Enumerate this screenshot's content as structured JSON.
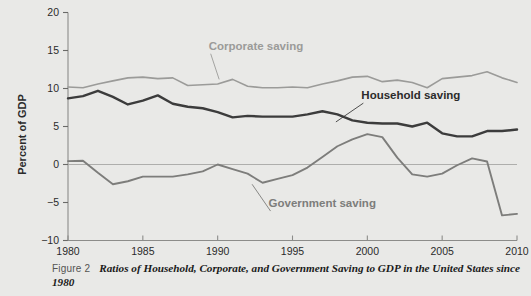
{
  "figure": {
    "caption_label": "Figure 2",
    "caption_title": "Ratios of Household, Corporate, and Government Saving to GDP in the United States since 1980",
    "background_color": "#e9e9e7"
  },
  "chart_data": {
    "type": "line",
    "title": "",
    "subtitle": "",
    "xlabel": "",
    "ylabel": "Percent of GDP",
    "xlim": [
      1980,
      2010
    ],
    "ylim": [
      -10,
      20
    ],
    "grid": false,
    "zero_line": true,
    "legend_position": "inline-annotations",
    "x_ticks": [
      1980,
      1985,
      1990,
      1995,
      2000,
      2005,
      2010
    ],
    "x_tick_labels": [
      "1980",
      "1985",
      "1990",
      "1995",
      "2000",
      "2005",
      "2010"
    ],
    "y_ticks": [
      -10,
      -5,
      0,
      5,
      10,
      15,
      20
    ],
    "y_tick_labels": [
      "−10",
      "−5",
      "0",
      "5",
      "10",
      "15",
      "20"
    ],
    "x": [
      1980,
      1981,
      1982,
      1983,
      1984,
      1985,
      1986,
      1987,
      1988,
      1989,
      1990,
      1991,
      1992,
      1993,
      1994,
      1995,
      1996,
      1997,
      1998,
      1999,
      2000,
      2001,
      2002,
      2003,
      2004,
      2005,
      2006,
      2007,
      2008,
      2009,
      2010
    ],
    "series": [
      {
        "name": "Corporate saving",
        "color": "#9b9b99",
        "width": 1.6,
        "values": [
          10.2,
          10.1,
          10.6,
          11.0,
          11.4,
          11.5,
          11.3,
          11.4,
          10.4,
          10.5,
          10.6,
          11.2,
          10.3,
          10.1,
          10.1,
          10.2,
          10.1,
          10.6,
          11.0,
          11.5,
          11.6,
          10.9,
          11.1,
          10.8,
          10.1,
          11.3,
          11.5,
          11.7,
          12.2,
          11.4,
          10.8
        ],
        "label_position": {
          "x": 1989.4,
          "y": 15.1
        },
        "leader_to": {
          "x": 1990.1,
          "y": 11.2
        }
      },
      {
        "name": "Household saving",
        "color": "#3c3c3c",
        "width": 2.4,
        "values": [
          8.7,
          9.0,
          9.7,
          8.9,
          7.9,
          8.4,
          9.1,
          8.0,
          7.6,
          7.4,
          6.9,
          6.2,
          6.4,
          6.3,
          6.3,
          6.3,
          6.6,
          7.0,
          6.6,
          5.8,
          5.5,
          5.4,
          5.4,
          5.0,
          5.5,
          4.1,
          3.7,
          3.7,
          4.4,
          4.4,
          4.6
        ],
        "label_position": {
          "x": 1999.6,
          "y": 8.6
        },
        "leader_to": {
          "x": 1997.9,
          "y": 5.6
        }
      },
      {
        "name": "Government saving",
        "color": "#7d7d7b",
        "width": 1.9,
        "values": [
          0.45,
          0.5,
          -1.1,
          -2.6,
          -2.2,
          -1.6,
          -1.6,
          -1.6,
          -1.3,
          -0.9,
          0.0,
          -0.6,
          -1.2,
          -2.4,
          -1.9,
          -1.4,
          -0.4,
          1.0,
          2.4,
          3.3,
          4.0,
          3.6,
          0.9,
          -1.3,
          -1.6,
          -1.2,
          -0.1,
          0.8,
          0.4,
          -6.7,
          -6.5
        ],
        "label_position": {
          "x": 1993.4,
          "y": -5.6
        },
        "leader_to": {
          "x": 1992.3,
          "y": -2.6
        }
      }
    ],
    "series_extra": [
      {
        "name": "Household saving",
        "note": "2005-2007 segment values",
        "values_2005_2008": [
          4.3,
          4.5,
          4.5,
          3.1
        ]
      },
      {
        "name": "Household saving",
        "note": "late segment",
        "values_2008_2010": [
          3.9,
          6.2,
          6.2
        ]
      }
    ]
  }
}
